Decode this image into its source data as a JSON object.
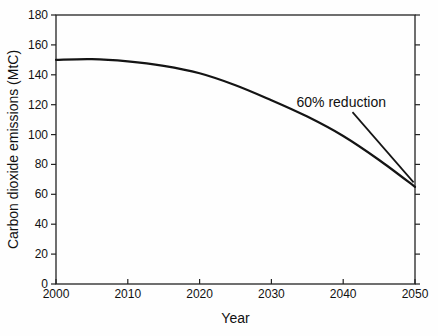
{
  "chart_data": {
    "type": "line",
    "title": "",
    "xlabel": "Year",
    "ylabel": "Carbon dioxide emissions (MtC)",
    "xlim": [
      2000,
      2050
    ],
    "ylim": [
      0,
      180
    ],
    "xticks": [
      2000,
      2010,
      2020,
      2030,
      2040,
      2050
    ],
    "yticks": [
      0,
      20,
      40,
      60,
      80,
      100,
      120,
      140,
      160,
      180
    ],
    "grid": false,
    "frame": "box",
    "legend": "none",
    "line_color": "#141414",
    "axis_color": "#222222",
    "background_color": "#fefefe",
    "series": [
      {
        "name": "CO2 emissions reduction scenario",
        "x": [
          2000,
          2005,
          2010,
          2015,
          2020,
          2025,
          2030,
          2035,
          2040,
          2045,
          2050
        ],
        "y": [
          150,
          150.5,
          149,
          146,
          141,
          133,
          123,
          112,
          99,
          83,
          65
        ]
      }
    ],
    "annotation": {
      "text": "60% reduction",
      "anchor_x": 2033.5,
      "anchor_y": 118.4,
      "leader_from": [
        2041.3,
        115
      ],
      "leader_to": [
        2049.8,
        68
      ]
    }
  }
}
